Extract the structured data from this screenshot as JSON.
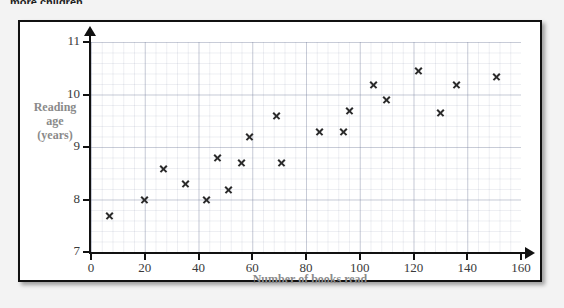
{
  "page": {
    "clipped_heading": "more children."
  },
  "chart_data": {
    "type": "scatter",
    "title": "",
    "xlabel": "Number of books read",
    "ylabel": "Reading age (years)",
    "ylabel_lines": [
      "Reading",
      "age",
      "(years)"
    ],
    "xlim": [
      0,
      160
    ],
    "ylim": [
      7,
      11
    ],
    "xticks": [
      0,
      20,
      40,
      60,
      80,
      100,
      120,
      140,
      160
    ],
    "yticks": [
      7,
      8,
      9,
      10,
      11
    ],
    "grid": true,
    "minor_grid": true,
    "legend": null,
    "marker": "x",
    "marker_color": "#2b2b2b",
    "points": [
      {
        "x": 7,
        "y": 7.7
      },
      {
        "x": 20,
        "y": 8.0
      },
      {
        "x": 27,
        "y": 8.6
      },
      {
        "x": 35,
        "y": 8.3
      },
      {
        "x": 43,
        "y": 8.0
      },
      {
        "x": 47,
        "y": 8.8
      },
      {
        "x": 51,
        "y": 8.2
      },
      {
        "x": 56,
        "y": 8.7
      },
      {
        "x": 59,
        "y": 9.2
      },
      {
        "x": 69,
        "y": 9.6
      },
      {
        "x": 71,
        "y": 8.7
      },
      {
        "x": 85,
        "y": 9.3
      },
      {
        "x": 94,
        "y": 9.3
      },
      {
        "x": 96,
        "y": 9.7
      },
      {
        "x": 105,
        "y": 10.2
      },
      {
        "x": 110,
        "y": 9.9
      },
      {
        "x": 122,
        "y": 10.45
      },
      {
        "x": 130,
        "y": 9.65
      },
      {
        "x": 136,
        "y": 10.2
      },
      {
        "x": 151,
        "y": 10.35
      }
    ]
  }
}
